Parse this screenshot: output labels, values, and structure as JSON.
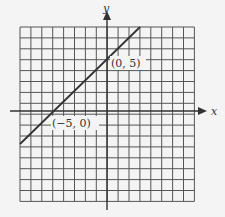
{
  "chart_data": {
    "type": "line",
    "title": "",
    "xlabel": "x",
    "ylabel": "y",
    "xlim": [
      -8,
      8
    ],
    "ylim": [
      -8,
      8
    ],
    "grid": true,
    "series": [
      {
        "name": "y = x + 5",
        "x": [
          -8,
          3
        ],
        "y": [
          -3,
          8
        ]
      }
    ],
    "annotations": [
      {
        "text": "(0, 5)",
        "x": 0,
        "y": 5
      },
      {
        "text": "(-5, 0)",
        "x": -5,
        "y": 0
      }
    ]
  },
  "labels": {
    "x_axis": "x",
    "y_axis": "y",
    "point_a": "(0, 5)",
    "point_b": "(−5, 0)"
  }
}
